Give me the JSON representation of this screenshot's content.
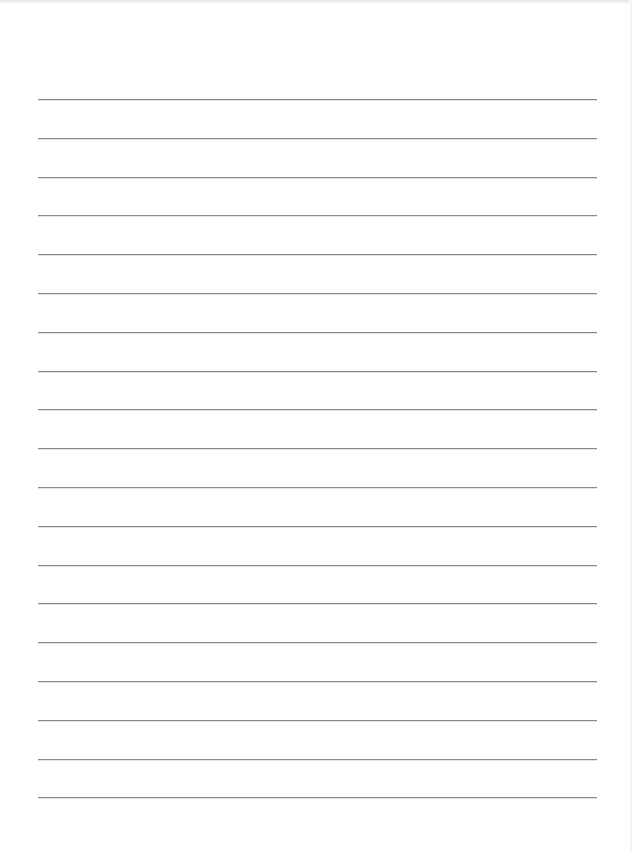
{
  "page": {
    "type": "lined-paper",
    "background_color": "#ffffff",
    "line_color": "#8a8a8a",
    "line_count": 19,
    "line_left": 38,
    "line_right": 597,
    "first_line_y": 99,
    "line_spacing": 38.8
  }
}
